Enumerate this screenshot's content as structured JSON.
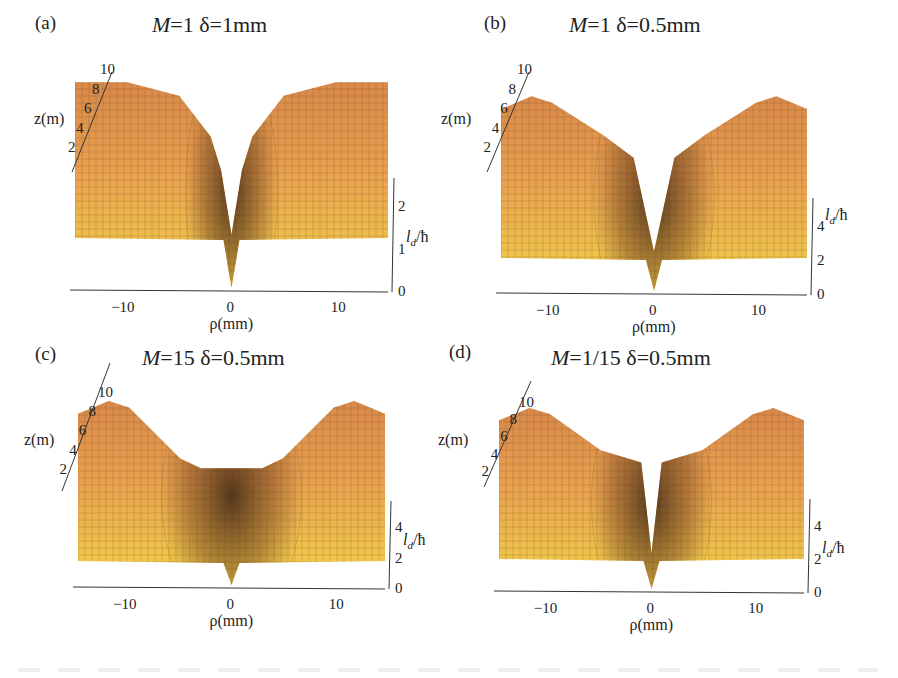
{
  "figure": {
    "panels": [
      {
        "id": "a",
        "label": "(a)",
        "title_M": "M",
        "title_rest": "=1  δ=1mm",
        "M": "1",
        "delta": "1mm",
        "ld_ticks": [
          "0",
          "1",
          "2"
        ],
        "ld_max": 2.6,
        "shape": "narrow"
      },
      {
        "id": "b",
        "label": "(b)",
        "title_M": "M",
        "title_rest": "=1  δ=0.5mm",
        "M": "1",
        "delta": "0.5mm",
        "ld_ticks": [
          "0",
          "2",
          "4"
        ],
        "ld_max": 5.5,
        "shape": "v"
      },
      {
        "id": "c",
        "label": "(c)",
        "title_M": "M",
        "title_rest": "=15  δ=0.5mm",
        "M": "15",
        "delta": "0.5mm",
        "ld_ticks": [
          "0",
          "2",
          "4"
        ],
        "ld_max": 5.5,
        "shape": "flat"
      },
      {
        "id": "d",
        "label": "(d)",
        "title_M": "M",
        "title_rest": "=1/15  δ=0.5mm",
        "M": "1/15",
        "delta": "0.5mm",
        "ld_ticks": [
          "0",
          "2",
          "4"
        ],
        "ld_max": 5.5,
        "shape": "v"
      }
    ],
    "axes": {
      "x_label": "ρ(mm)",
      "x_ticks": [
        "−10",
        "0",
        "10"
      ],
      "z_label": "z(m)",
      "z_ticks": [
        "2",
        "4",
        "6",
        "8",
        "10"
      ],
      "y_label_main": "l",
      "y_label_sub": "d",
      "y_label_tail": "/ħ"
    },
    "colors": {
      "surface_light": "#f2d34a",
      "surface_mid": "#e9a24e",
      "surface_dark": "#3a2414",
      "mesh": "#6b4a25",
      "axis": "#333333"
    }
  },
  "chart_data": [
    {
      "type": "surface",
      "title": "(a) M=1 δ=1mm",
      "xlabel": "ρ(mm)",
      "ylabel": "z(m)",
      "zlabel": "l_d/ħ",
      "x_range": [
        -15,
        15
      ],
      "y_range": [
        0,
        10
      ],
      "z_range": [
        0,
        2.6
      ],
      "x_ticks": [
        -10,
        0,
        10
      ],
      "y_ticks": [
        2,
        4,
        6,
        8,
        10
      ],
      "z_ticks": [
        0,
        1,
        2
      ],
      "profile_at_z10": {
        "rho": [
          -15,
          -10,
          -5,
          -2,
          -1,
          0,
          1,
          2,
          5,
          10,
          15
        ],
        "ld": [
          2.3,
          2.3,
          2.1,
          1.5,
          1.0,
          0.05,
          1.0,
          1.5,
          2.1,
          2.3,
          2.3
        ]
      },
      "edge_value_far_rho": 1.15
    },
    {
      "type": "surface",
      "title": "(b) M=1 δ=0.5mm",
      "xlabel": "ρ(mm)",
      "ylabel": "z(m)",
      "zlabel": "l_d/ħ",
      "x_range": [
        -15,
        15
      ],
      "y_range": [
        0,
        10
      ],
      "z_range": [
        0,
        5.5
      ],
      "x_ticks": [
        -10,
        0,
        10
      ],
      "y_ticks": [
        2,
        4,
        6,
        8,
        10
      ],
      "z_ticks": [
        0,
        2,
        4
      ],
      "profile_at_z10": {
        "rho": [
          -15,
          -12,
          -10,
          -5,
          -2,
          0,
          2,
          5,
          10,
          12,
          15
        ],
        "ld": [
          4.6,
          5.0,
          4.8,
          3.8,
          3.1,
          0.2,
          3.1,
          3.8,
          4.8,
          5.0,
          4.6
        ]
      },
      "edge_value_far_rho": 1.7
    },
    {
      "type": "surface",
      "title": "(c) M=15 δ=0.5mm",
      "xlabel": "ρ(mm)",
      "ylabel": "z(m)",
      "zlabel": "l_d/ħ",
      "x_range": [
        -15,
        15
      ],
      "y_range": [
        0,
        10
      ],
      "z_range": [
        0,
        5.5
      ],
      "x_ticks": [
        -10,
        0,
        10
      ],
      "y_ticks": [
        2,
        4,
        6,
        8,
        10
      ],
      "z_ticks": [
        0,
        2,
        4
      ],
      "profile_at_z10": {
        "rho": [
          -15,
          -12,
          -10,
          -5,
          -3,
          0,
          3,
          5,
          10,
          12,
          15
        ],
        "ld": [
          4.6,
          5.0,
          4.8,
          3.2,
          2.9,
          2.9,
          2.9,
          3.2,
          4.8,
          5.0,
          4.6
        ]
      },
      "edge_value_far_rho": 1.7
    },
    {
      "type": "surface",
      "title": "(d) M=1/15 δ=0.5mm",
      "xlabel": "ρ(mm)",
      "ylabel": "z(m)",
      "zlabel": "l_d/ħ",
      "x_range": [
        -15,
        15
      ],
      "y_range": [
        0,
        10
      ],
      "z_range": [
        0,
        5.5
      ],
      "x_ticks": [
        -10,
        0,
        10
      ],
      "y_ticks": [
        2,
        4,
        6,
        8,
        10
      ],
      "z_ticks": [
        0,
        2,
        4
      ],
      "profile_at_z10": {
        "rho": [
          -15,
          -12,
          -10,
          -5,
          -1,
          0,
          1,
          5,
          10,
          12,
          15
        ],
        "ld": [
          4.6,
          5.0,
          4.8,
          3.6,
          3.2,
          0.2,
          3.2,
          3.6,
          4.8,
          5.0,
          4.6
        ]
      },
      "edge_value_far_rho": 1.7
    }
  ]
}
